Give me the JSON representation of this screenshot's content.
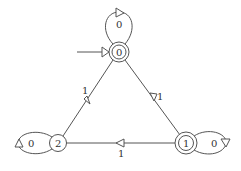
{
  "diagram": {
    "type": "finite-state-automaton",
    "colors": {
      "stroke": "#555555",
      "text": "#333333",
      "background": "#ffffff"
    },
    "start_state": "0",
    "states": [
      {
        "id": "0",
        "label": "0",
        "accepting": true,
        "initial": true
      },
      {
        "id": "1",
        "label": "1",
        "accepting": true,
        "initial": false
      },
      {
        "id": "2",
        "label": "2",
        "accepting": false,
        "initial": false
      }
    ],
    "transitions": [
      {
        "from": "0",
        "to": "0",
        "label": "0"
      },
      {
        "from": "0",
        "to": "2",
        "label": "1"
      },
      {
        "from": "0",
        "to": "1",
        "label": "1"
      },
      {
        "from": "1",
        "to": "1",
        "label": "0"
      },
      {
        "from": "1",
        "to": "2",
        "label": "1"
      },
      {
        "from": "2",
        "to": "2",
        "label": "0"
      }
    ]
  }
}
